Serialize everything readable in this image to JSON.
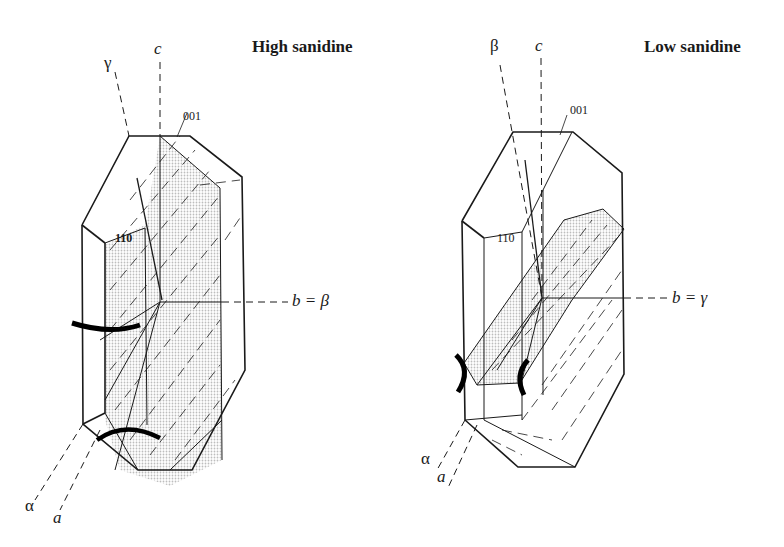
{
  "figure": {
    "panels": [
      {
        "title": "High sanidine",
        "labels": {
          "axis_c": "c",
          "optic_top": "γ",
          "face_001": "001",
          "face_110": "110",
          "axis_b": "b = β",
          "optic_alpha": "α",
          "axis_a": "a"
        }
      },
      {
        "title": "Low sanidine",
        "labels": {
          "axis_c": "c",
          "optic_top": "β",
          "face_001": "001",
          "face_110": "110",
          "axis_b": "b = γ",
          "optic_alpha": "α",
          "axis_a": "a"
        }
      }
    ],
    "colors": {
      "line": "#1a1a1a",
      "shade": "#e6e6e6",
      "background": "#ffffff"
    }
  }
}
